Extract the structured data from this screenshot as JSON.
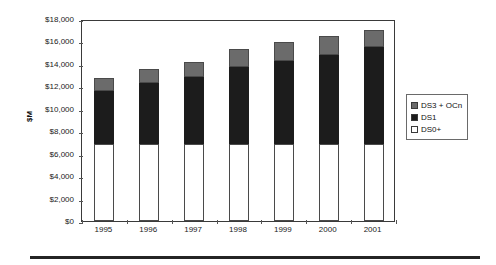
{
  "chart_data": {
    "type": "bar",
    "stacked": true,
    "title": "",
    "xlabel": "",
    "ylabel": "$M",
    "categories": [
      "1995",
      "1996",
      "1997",
      "1998",
      "1999",
      "2000",
      "2001"
    ],
    "series": [
      {
        "name": "DS0+",
        "color": "#ffffff",
        "values": [
          6900,
          6900,
          6900,
          6900,
          6900,
          6900,
          6900
        ]
      },
      {
        "name": "DS1",
        "color": "#1c1c1c",
        "values": [
          4690,
          5400,
          5940,
          6820,
          7360,
          7890,
          8610
        ]
      },
      {
        "name": "DS3 + OCn",
        "color": "#6b6b6b",
        "values": [
          1160,
          1250,
          1330,
          1610,
          1690,
          1700,
          1520
        ]
      }
    ],
    "totals": [
      12750,
      13550,
      14170,
      15330,
      15950,
      16490,
      17030
    ],
    "ylim": [
      0,
      18000
    ],
    "ytick_step": 2000,
    "ytick_labels": [
      "$0",
      "$2,000",
      "$4,000",
      "$6,000",
      "$8,000",
      "$10,000",
      "$12,000",
      "$14,000",
      "$16,000",
      "$18,000"
    ],
    "ytick_values": [
      0,
      2000,
      4000,
      6000,
      8000,
      10000,
      12000,
      14000,
      16000,
      18000
    ],
    "grid": false,
    "legend_position": "right",
    "legend": [
      {
        "label": "DS3 + OCn",
        "swatch": "gray"
      },
      {
        "label": "DS1",
        "swatch": "black"
      },
      {
        "label": "DS0+",
        "swatch": "white"
      }
    ]
  },
  "axis": {
    "y_title": "$M"
  },
  "colors": {
    "ds0_fill": "#ffffff",
    "ds1_fill": "#1c1c1c",
    "ds3_fill": "#6b6b6b",
    "outline": "#4a4a4a",
    "frame": "#3a3a3a",
    "rule": "#242424"
  }
}
